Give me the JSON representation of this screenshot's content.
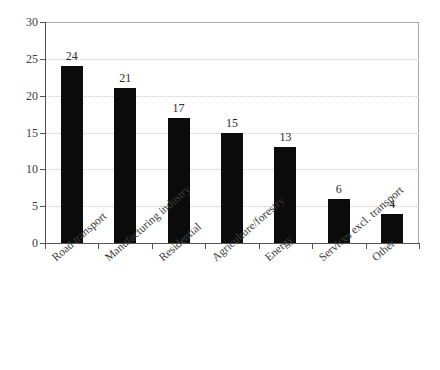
{
  "chart_data": {
    "type": "bar",
    "title": "",
    "subtitle": "",
    "xlabel": "",
    "ylabel": "",
    "ylim": [
      0,
      30
    ],
    "yticks": [
      0,
      5,
      10,
      15,
      20,
      25,
      30
    ],
    "grid": true,
    "legend": null,
    "bar_color": "#0b0b0b",
    "gridline_color": "#c9c9c9",
    "frame_color": "#a8a8a8",
    "axis_color": "#555555",
    "show_data_labels": true,
    "categories": [
      "Road transport",
      "Manufacturing industry",
      "Residential",
      "Agriculture/forestry",
      "Energy",
      "Services excl. transport",
      "Other"
    ],
    "values": [
      24,
      21,
      17,
      15,
      13,
      6,
      4
    ]
  },
  "axis": {
    "y_tick_labels": [
      "30",
      "25",
      "20",
      "15",
      "10",
      "5",
      "0"
    ]
  }
}
